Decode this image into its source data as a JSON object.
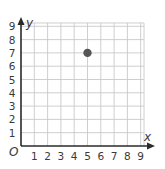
{
  "chart_data": {
    "type": "scatter",
    "title": "",
    "xlabel": "x",
    "ylabel": "y",
    "origin_label": "O",
    "xlim": [
      0,
      9
    ],
    "ylim": [
      0,
      9
    ],
    "grid": true,
    "x_ticks": [
      "1",
      "2",
      "3",
      "4",
      "5",
      "6",
      "7",
      "8",
      "9"
    ],
    "y_ticks": [
      "1",
      "2",
      "3",
      "4",
      "5",
      "6",
      "7",
      "8",
      "9"
    ],
    "series": [
      {
        "name": "point",
        "points": [
          {
            "x": 5,
            "y": 7
          }
        ],
        "color": "#555555"
      }
    ]
  },
  "colors": {
    "grid": "#c8c8c8",
    "axis": "#2a2a2a",
    "point": "#555555"
  }
}
